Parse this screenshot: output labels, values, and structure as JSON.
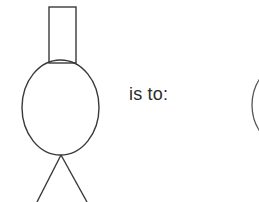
{
  "canvas": {
    "width": 259,
    "height": 202,
    "background": "#ffffff"
  },
  "prompt": {
    "text": "is to:"
  },
  "colors": {
    "stroke": "#3a3a3a",
    "stroke_light": "#555555",
    "text": "#2b2b2b",
    "background": "#ffffff"
  },
  "left_figure": {
    "name": "stick-figure-with-rectangle-head",
    "parts": [
      {
        "name": "rectangle",
        "shape": "rect",
        "x": 49,
        "y": 7,
        "width": 27,
        "height": 56
      },
      {
        "name": "ellipse-body",
        "shape": "ellipse",
        "cx": 60.5,
        "cy": 107.5,
        "rx": 38.5,
        "ry": 47.5
      },
      {
        "name": "left-leg",
        "shape": "line",
        "x1": 61,
        "y1": 155,
        "x2": 37,
        "y2": 202
      },
      {
        "name": "right-leg",
        "shape": "line",
        "x1": 61,
        "y1": 155,
        "x2": 87,
        "y2": 202
      }
    ]
  },
  "right_figure": {
    "name": "partial-circle-clipped-at-right-edge",
    "parts": [
      {
        "name": "circle-arc",
        "shape": "circle",
        "cx": 300,
        "cy": 105,
        "r": 48
      }
    ]
  }
}
